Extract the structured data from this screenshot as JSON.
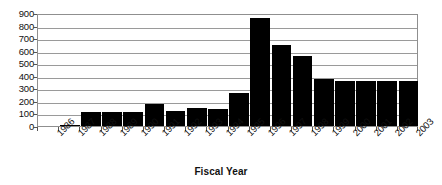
{
  "chart_data": {
    "type": "bar",
    "title": "",
    "subtitle": "",
    "xlabel": "Fiscal Year",
    "ylabel": "",
    "categories": [
      "1986",
      "1987",
      "1988",
      "1989",
      "1990",
      "1991",
      "1992",
      "1993",
      "1994",
      "1995",
      "1996",
      "1997",
      "1998",
      "1999",
      "2000",
      "2001",
      "2002",
      "2003"
    ],
    "values": [
      0,
      12,
      112,
      115,
      112,
      175,
      122,
      140,
      137,
      262,
      860,
      648,
      560,
      375,
      355,
      358,
      360,
      362
    ],
    "series": [
      {
        "name": "",
        "values": [
          0,
          12,
          112,
          115,
          112,
          175,
          122,
          140,
          137,
          262,
          860,
          648,
          560,
          375,
          355,
          358,
          360,
          362
        ]
      }
    ],
    "ylim": [
      0,
      900
    ],
    "ytick_values": [
      0,
      100,
      200,
      300,
      400,
      500,
      600,
      700,
      800,
      900
    ],
    "ytick_labels": [
      "0",
      "100",
      "200",
      "300",
      "400",
      "500",
      "600",
      "700",
      "800",
      "900"
    ],
    "grid": "horizontal",
    "legend": "none",
    "bar_color": "#000000",
    "grid_color": "#9a9a9a",
    "axis_color": "#8f8f8f",
    "plot_background": "#ffffff",
    "xtick_rotation": -45
  }
}
